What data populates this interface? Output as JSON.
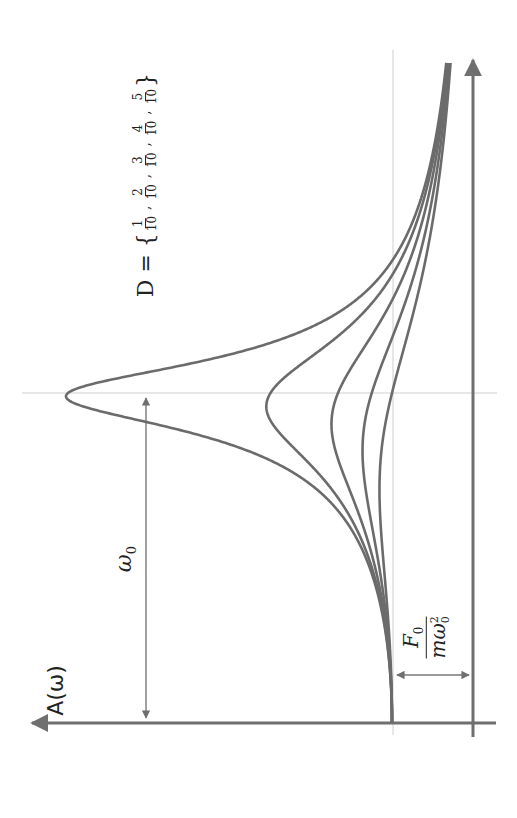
{
  "chart_data": {
    "type": "line",
    "orientation": "rotated 90° counter-clockwise",
    "xlabel": "ω",
    "ylabel": "A(ω)",
    "x_marker": "ω0",
    "y_marker": "F0 / (m ω0²)",
    "damping_label": "D = { 1/10, 2/10, 3/10, 4/10, 5/10 }",
    "damping_values": [
      0.1,
      0.2,
      0.3,
      0.4,
      0.5
    ],
    "x_range_in_units_of_omega0": [
      0,
      2.0
    ],
    "y_unit": "F0/(m ω0²)",
    "series": [
      {
        "name": "D = 1/10",
        "peak_r": 0.99,
        "peak_A": 5.03
      },
      {
        "name": "D = 2/10",
        "peak_r": 0.96,
        "peak_A": 2.55
      },
      {
        "name": "D = 3/10",
        "peak_r": 0.91,
        "peak_A": 1.75
      },
      {
        "name": "D = 4/10",
        "peak_r": 0.82,
        "peak_A": 1.36
      },
      {
        "name": "D = 5/10",
        "peak_r": 0.71,
        "peak_A": 1.15
      }
    ],
    "grid": false,
    "legend": "none",
    "colors": {
      "curve": "#6b6b6b",
      "axis": "#6f6f6f",
      "guide": "#c8c8c8"
    }
  },
  "labels": {
    "y_axis": "A(ω)",
    "omega0": "ω",
    "omega0_sub": "0",
    "f0_num": "F",
    "f0_num_sub": "0",
    "f0_den": "mω",
    "f0_den_sup": "2",
    "f0_den_sub": "0",
    "damping_prefix": "D = {",
    "damping_fracs": [
      "1",
      "2",
      "3",
      "4",
      "5"
    ],
    "damping_den": "10",
    "damping_suffix": "}"
  }
}
